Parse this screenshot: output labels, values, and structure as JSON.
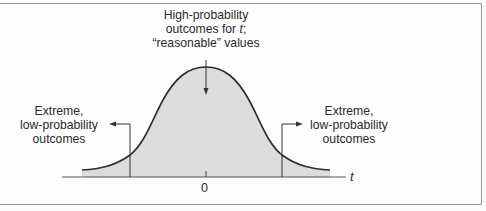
{
  "diagram": {
    "type": "t-distribution",
    "annotations": {
      "center": {
        "lines": [
          "High-probability",
          "outcomes for ",
          "“reasonable” values"
        ],
        "variable": "t",
        "suffix": ";"
      },
      "left_tail": {
        "lines": [
          "Extreme,",
          "low-probability",
          "outcomes"
        ]
      },
      "right_tail": {
        "lines": [
          "Extreme,",
          "low-probability",
          "outcomes"
        ]
      }
    },
    "axis": {
      "label": "t",
      "tick_label": "0"
    },
    "colors": {
      "fill": "#dcdcdc",
      "curve": "#2b2b2b",
      "axis": "#555555",
      "border": "#9a9a9a"
    }
  }
}
